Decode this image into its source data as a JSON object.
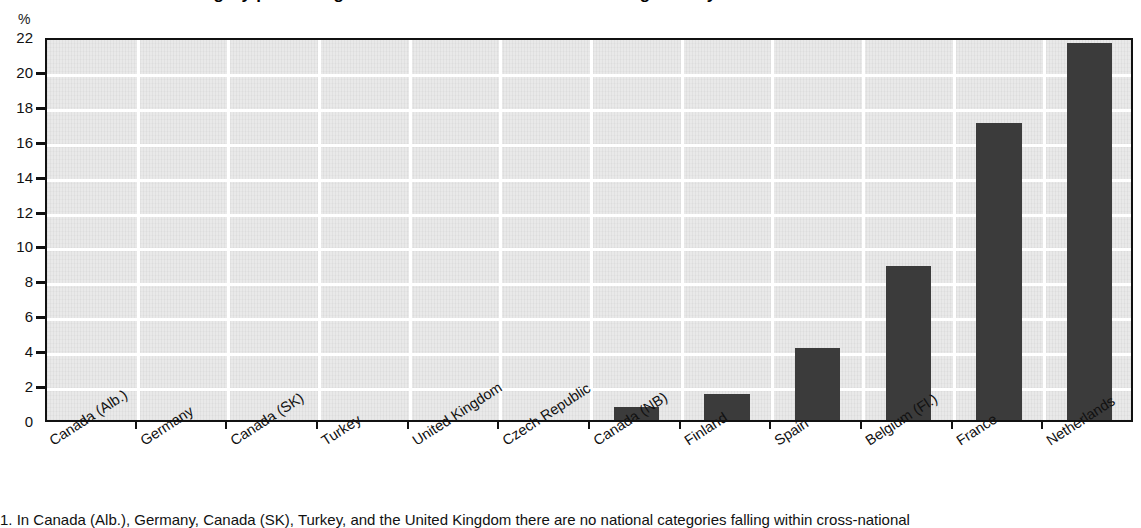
{
  "figure": {
    "title": "Cross-national category per centage of students at each level of reading literacy",
    "note": "1. In Canada (Alb.), Germany, Canada (SK), Turkey, and the United Kingdom there are no national categories falling within cross-national",
    "unit_label": "%"
  },
  "colors": {
    "bar": "#3b3b3b",
    "plot_background": "#e9e9e9",
    "gridline": "#ffffff",
    "axis": "#111111"
  },
  "chart_data": {
    "type": "bar",
    "title": "Cross-national category per centage of students at each level of reading literacy",
    "xlabel": "",
    "ylabel": "%",
    "ylim": [
      0,
      22
    ],
    "ytick_step": 2,
    "ytick_labels": [
      "22",
      "20",
      "18",
      "16",
      "14",
      "12",
      "10",
      "8",
      "6",
      "4",
      "2",
      "0"
    ],
    "grid": true,
    "legend": "none",
    "categories": [
      "Canada (Alb.)",
      "Germany",
      "Canada (SK)",
      "Turkey",
      "United Kingdom",
      "Czech Republic",
      "Canada (NB)",
      "Finland",
      "Spain",
      "Belgium (Fl.)",
      "France",
      "Netherlands"
    ],
    "values": [
      0,
      0,
      0,
      0,
      0,
      0,
      0.75,
      1.5,
      4.1,
      8.8,
      17.0,
      21.6
    ]
  }
}
